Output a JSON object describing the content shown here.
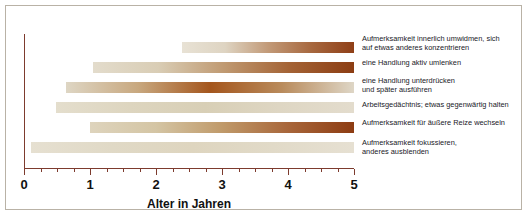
{
  "chart_data": {
    "type": "bar",
    "orientation": "horizontal",
    "title": "",
    "xlabel": "Alter in Jahren",
    "ylabel": "",
    "xlim": [
      0,
      5
    ],
    "xticks": [
      0,
      1,
      2,
      3,
      4,
      5
    ],
    "xtick_labels": [
      "0",
      "1",
      "2",
      "3",
      "4",
      "5"
    ],
    "minor_tick_step": 0.25,
    "grid": false,
    "legend": "none",
    "note": "Ranges (Spannen) of age in years during which each executive-function skill develops; colour intensity indicates the developmental peak.",
    "categories": [
      "Aufmerksamkeit innerlich umwidmen, sich\nauf etwas anderes konzentrieren",
      "eine Handlung aktiv umlenken",
      "eine Handlung unterdrücken\nund später ausführen",
      "Arbeitsgedächtnis; etwas gegenwärtig halten",
      "Aufmerksamkeit für äußere Reize wechseln",
      "Aufmerksamkeit fokussieren,\nanderes ausblenden"
    ],
    "bars": [
      {
        "label": "Aufmerksamkeit innerlich umwidmen, sich\nauf etwas anderes konzentrieren",
        "start": 2.4,
        "end": 5.0,
        "gradient": [
          "#e8e2d5",
          "#ded4c2",
          "#c29a78",
          "#a7683f",
          "#8f3f17"
        ],
        "peak_side": "right"
      },
      {
        "label": "eine Handlung aktiv umlenken",
        "start": 1.05,
        "end": 5.0,
        "gradient": [
          "#e3dccc",
          "#d9cdb5",
          "#c09a72",
          "#a46335",
          "#8c3d13"
        ],
        "peak_side": "right"
      },
      {
        "label": "eine Handlung unterdrücken\nund später ausführen",
        "start": 0.64,
        "end": 5.0,
        "gradient": [
          "#ded6c4",
          "#c8a87f",
          "#a4561d",
          "#b98b5c",
          "#ded6c6"
        ],
        "peak_side": "middle"
      },
      {
        "label": "Arbeitsgedächtnis; etwas gegenwärtig halten",
        "start": 0.48,
        "end": 5.0,
        "gradient": [
          "#e4decd",
          "#ddd5bf",
          "#d8cfb6",
          "#ded6c3",
          "#e3dccd"
        ],
        "peak_side": "flat"
      },
      {
        "label": "Aufmerksamkeit für äußere Reize wechseln",
        "start": 1.0,
        "end": 5.0,
        "gradient": [
          "#ded4bd",
          "#d4c5a4",
          "#c09a6a",
          "#a8663a",
          "#8d3c12"
        ],
        "peak_side": "right"
      },
      {
        "label": "Aufmerksamkeit fokussieren,\nanderes ausblenden",
        "start": 0.1,
        "end": 5.0,
        "gradient": [
          "#e6e0d1",
          "#e0d9c6",
          "#ded5bf",
          "#e1dac8",
          "#e6e0d2"
        ],
        "peak_side": "flat"
      }
    ],
    "colors": {
      "axis": "#7d3b2e",
      "frame": "#b9b2a6",
      "text": "#20201f",
      "tick_text": "#111111",
      "background": "#ffffff",
      "bar_light": "#e6e0d1",
      "bar_dark": "#8c3d13"
    }
  }
}
